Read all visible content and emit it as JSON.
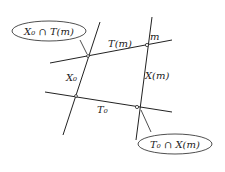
{
  "diagram": {
    "lines": [
      {
        "id": "X0",
        "label": "X₀"
      },
      {
        "id": "Xm",
        "label": "X(m)"
      },
      {
        "id": "Tm",
        "label": "T(m)"
      },
      {
        "id": "T0",
        "label": "T₀"
      }
    ],
    "point_label": "m",
    "callouts": [
      {
        "id": "top-left",
        "label": "X₀ ∩ T(m)"
      },
      {
        "id": "bottom-right",
        "label": "T₀ ∩ X(m)"
      }
    ],
    "colors": {
      "stroke": "#222222",
      "background": "#ffffff"
    }
  }
}
